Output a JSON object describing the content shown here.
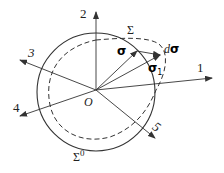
{
  "diagram": {
    "origin_label": "O",
    "axes": [
      {
        "id": "1",
        "label": "1"
      },
      {
        "id": "2",
        "label": "2"
      },
      {
        "id": "3",
        "label": "3"
      },
      {
        "id": "4",
        "label": "4"
      },
      {
        "id": "5",
        "label": "5"
      }
    ],
    "surfaces": {
      "initial": {
        "label_base": "Σ",
        "label_sup": "0",
        "style": "solid"
      },
      "current": {
        "label": "Σ",
        "style": "dashed"
      }
    },
    "vectors": {
      "sigma": {
        "label": "σ"
      },
      "sigma1": {
        "label_base": "σ",
        "label_sub": "1"
      },
      "dsigma": {
        "label_d": "d",
        "label_sigma": "σ"
      }
    },
    "colors": {
      "stroke": "#333333",
      "background": "#ffffff"
    }
  }
}
